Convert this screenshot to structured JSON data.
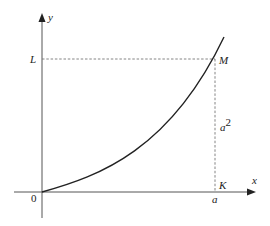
{
  "diagram": {
    "type": "function-graph",
    "axes": {
      "x_label": "x",
      "y_label": "y",
      "origin_label": "0"
    },
    "curve": {
      "description": "increasing curve y = x^2 from origin through M"
    },
    "points": {
      "M": "M",
      "K": "K",
      "L": "L"
    },
    "labels": {
      "a": "a",
      "a_base": "a",
      "a_exp": "2"
    },
    "colors": {
      "axis": "#555555",
      "curve": "#222222",
      "dashed": "#777777"
    }
  }
}
